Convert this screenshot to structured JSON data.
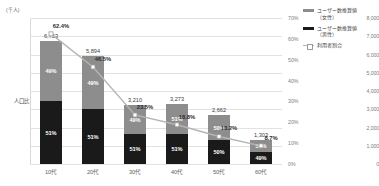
{
  "chart_data": {
    "type": "bar",
    "title": "",
    "subtitle": "",
    "xlabel": "",
    "ylabel": "(千人)",
    "y2label": "",
    "categories": [
      "10代",
      "20代",
      "30代",
      "40代",
      "50代",
      "60代"
    ],
    "ylim": [
      0,
      8000
    ],
    "y2lim": [
      0,
      70
    ],
    "grid": true,
    "legend_position": "right",
    "series": [
      {
        "name": "ユーザー数推算値（女性）",
        "type": "bar-segment",
        "color": "#8d8d8d",
        "values": [
          3309,
          2888,
          1573,
          1604,
          1331,
          664
        ],
        "share_labels": [
          "49%",
          "49%",
          "49%",
          "51%",
          "50%",
          "51%"
        ]
      },
      {
        "name": "ユーザー数推算値（男性）",
        "type": "bar-segment",
        "color": "#1a1a1a",
        "values": [
          3444,
          3006,
          1637,
          1669,
          1331,
          639
        ],
        "share_labels": [
          "51%",
          "51%",
          "51%",
          "51%",
          "50%",
          "49%"
        ]
      },
      {
        "name": "利用者割合",
        "type": "line",
        "color": "#b5b5b5",
        "values": [
          62.4,
          46.5,
          23.5,
          18.8,
          13.2,
          8.7
        ],
        "value_labels": [
          "62.4%",
          "46.5%",
          "23.5%",
          "18.8%",
          "13.2%",
          "8.7%"
        ]
      }
    ],
    "bar_totals": [
      6753,
      5894,
      3210,
      3273,
      2662,
      1303
    ],
    "bar_total_labels": [
      "6,753",
      "5,894",
      "3,210",
      "3,273",
      "2,662",
      "1,303"
    ],
    "y_ticks": [
      "0",
      "1,000",
      "2,000",
      "3,000",
      "4,000",
      "5,000",
      "6,000",
      "7,000",
      "8,000"
    ],
    "y_tick_values": [
      0,
      1000,
      2000,
      3000,
      4000,
      5000,
      6000,
      7000,
      8000
    ],
    "y2_ticks": [
      "0%",
      "10%",
      "20%",
      "30%",
      "40%",
      "50%",
      "60%",
      "70%"
    ],
    "y2_tick_values": [
      0,
      10,
      20,
      30,
      40,
      50,
      60,
      70
    ],
    "annotations": [
      {
        "text": "人口比",
        "target": "male-segment-10dai"
      }
    ]
  },
  "legend": {
    "items": [
      {
        "label": "ユーザー数推算値",
        "sub": "（女性）",
        "swatch": "female"
      },
      {
        "label": "ユーザー数推算値",
        "sub": "（男性）",
        "swatch": "male"
      },
      {
        "label": "利用者割合",
        "sub": "",
        "swatch": "line"
      }
    ]
  }
}
